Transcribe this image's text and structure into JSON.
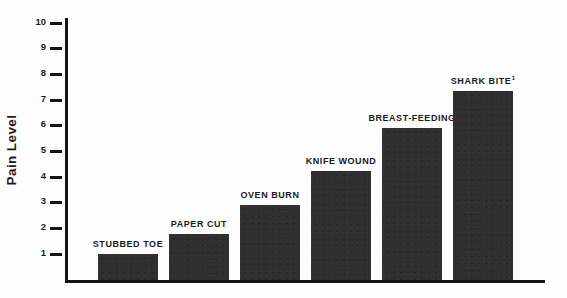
{
  "chart_data": {
    "type": "bar",
    "title": "",
    "xlabel": "",
    "ylabel": "Pain Level",
    "categories": [
      "STUBBED TOE",
      "PAPER CUT",
      "OVEN BURN",
      "KNIFE WOUND",
      "BREAST-FEEDING",
      "SHARK BITE"
    ],
    "values": [
      1.0,
      1.8,
      2.9,
      4.25,
      5.9,
      7.35
    ],
    "value_labels": [
      "",
      "",
      "",
      "",
      "",
      ""
    ],
    "footnote_markers": [
      "",
      "",
      "",
      "",
      "",
      "1"
    ],
    "ylim": [
      0,
      10
    ],
    "ytick_labels": [
      "10",
      "9",
      "8",
      "7",
      "6",
      "5",
      "4",
      "3",
      "2",
      "1"
    ],
    "ytick_values": [
      10,
      9,
      8,
      7,
      6,
      5,
      4,
      3,
      2,
      1
    ],
    "grid": false,
    "legend": false,
    "bar_color": "#2f2f2f",
    "axis_color": "#141414",
    "text_color": "#1b1b1b",
    "background_color": "#fdfdfd"
  },
  "bars": [
    {
      "label": "STUBBED TOE",
      "value": 1.0,
      "marker": ""
    },
    {
      "label": "PAPER CUT",
      "value": 1.8,
      "marker": ""
    },
    {
      "label": "OVEN BURN",
      "value": 2.9,
      "marker": ""
    },
    {
      "label": "KNIFE WOUND",
      "value": 4.25,
      "marker": ""
    },
    {
      "label": "BREAST-FEEDING",
      "value": 5.9,
      "marker": ""
    },
    {
      "label": "SHARK BITE",
      "value": 7.35,
      "marker": "1"
    }
  ],
  "axis": {
    "y_title": "Pain Level",
    "ticks": [
      "10",
      "9",
      "8",
      "7",
      "6",
      "5",
      "4",
      "3",
      "2",
      "1"
    ]
  }
}
